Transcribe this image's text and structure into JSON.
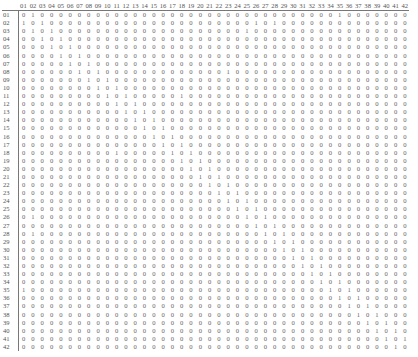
{
  "matrix": {
    "size": 42,
    "col_labels": [
      "01",
      "02",
      "03",
      "04",
      "05",
      "06",
      "07",
      "08",
      "09",
      "10",
      "11",
      "12",
      "13",
      "14",
      "15",
      "16",
      "17",
      "18",
      "19",
      "20",
      "21",
      "22",
      "23",
      "24",
      "25",
      "26",
      "27",
      "28",
      "29",
      "30",
      "31",
      "32",
      "33",
      "34",
      "35",
      "36",
      "37",
      "38",
      "39",
      "40",
      "41",
      "42"
    ],
    "row_labels": [
      "01",
      "02",
      "03",
      "04",
      "05",
      "06",
      "07",
      "08",
      "09",
      "10",
      "11",
      "12",
      "13",
      "14",
      "15",
      "16",
      "17",
      "18",
      "19",
      "20",
      "21",
      "22",
      "23",
      "24",
      "25",
      "26",
      "27",
      "28",
      "29",
      "30",
      "31",
      "32",
      "33",
      "34",
      "35",
      "36",
      "37",
      "38",
      "39",
      "40",
      "41",
      "42"
    ],
    "rows": [
      "010000000000000000000000000000000010000000",
      "101000000000000000000000010100000000000000",
      "010100000000000000000000100000000000000000",
      "001010000000000000000000000000000000000000",
      "000101000000000000000000000000000000000000",
      "000010100000000000000000000000000000000000",
      "000001010000000000000000000000000000000000",
      "000000101000000000000010000000000000000000",
      "000000010100000000000000000000000000000000",
      "000000001010000000000000000000000000000000",
      "000000000101000001000000000000000000000000",
      "000000000010100000000000000000000000000000",
      "000000000001010000000000000000000000000000",
      "000000000000101000000000000000000000000000",
      "000000000000010100000000000000000000000000",
      "000000000000001010000000000000000000000000",
      "000000000000000101000000000000000000000000",
      "000000000010000010100000000000000000000000",
      "000000000000000001010000000000000000000000",
      "000000000000000000101000000000000000000000",
      "000000000000000000010100000000000000000000",
      "000000000000000000001010000000000000000000",
      "000000000000000000000101000000000000000000",
      "000000000000000000000010100000000000000000",
      "000000000000000000000001010000000000000000",
      "010000000000000000000000101000000000000000",
      "000000000000000000000000010100000000000000",
      "010000000000000000000000001010000000000000",
      "000000000000000000000000000101000000000000",
      "000000000000000000000000000010100000000000",
      "000000000000000000000000000001010000000000",
      "000000000000000000000000000000101000000000",
      "000000000000000000000000000000010100000000",
      "000000000000000000000000000000001010000000",
      "100000000000000000000000000000000101000000",
      "000000000000000000000000000000000010100000",
      "000000000000000000000000000000000001010000",
      "000000000000000000000000000000000000101000",
      "000000000000000000000000000000000000010100",
      "000000000000000000000000000000000000001010",
      "000000000000000000000000000000000000000101",
      "000000000000000000000000000000000000000010"
    ]
  }
}
